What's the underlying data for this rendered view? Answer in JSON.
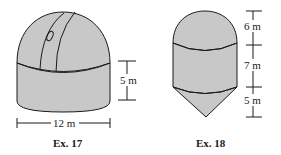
{
  "figures": [
    {
      "caption": "Ex. 17",
      "shape": "cylinder topped by hemisphere (observatory dome)",
      "dimensions": {
        "height_label": "5 m",
        "width_label": "12 m"
      }
    },
    {
      "caption": "Ex. 18",
      "shape": "hemisphere on cylinder on cone (silo)",
      "dimensions": {
        "top_label": "6 m",
        "middle_label": "7 m",
        "bottom_label": "5 m"
      }
    }
  ],
  "colors": {
    "fill": "#c8c8c8",
    "stroke": "#1a1a1a",
    "background": "#ffffff"
  }
}
